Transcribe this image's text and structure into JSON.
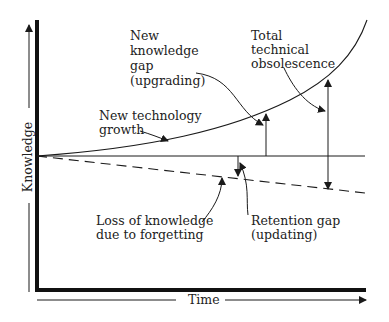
{
  "diagram": {
    "title": "",
    "axes": {
      "y_label": "Knowledge",
      "x_label": "Time"
    },
    "curves": [
      {
        "name": "New technology growth",
        "style": "solid-curve"
      },
      {
        "name": "Baseline knowledge",
        "style": "solid-horizontal"
      },
      {
        "name": "Loss of knowledge due to forgetting",
        "style": "dashed-declining"
      }
    ],
    "labels": {
      "new_gap": [
        "New",
        "knowledge",
        "gap",
        "(upgrading)"
      ],
      "total_obs": [
        "Total",
        "technical",
        "obsolescence"
      ],
      "tech_growth": [
        "New technology",
        "growth"
      ],
      "loss": [
        "Loss of knowledge",
        "due to forgetting"
      ],
      "retention": [
        "Retention gap",
        "(updating)"
      ]
    },
    "colors": {
      "line": "#1a1a1a",
      "text": "#222222",
      "background": "#ffffff"
    }
  }
}
